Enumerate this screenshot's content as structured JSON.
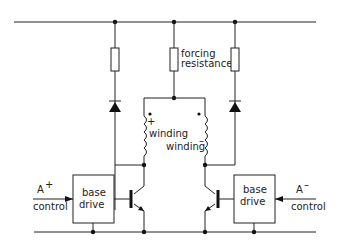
{
  "diagram": {
    "type": "circuit",
    "labels": {
      "forcing_line1": "forcing",
      "forcing_line2": "resistance",
      "winding_plus_sign": "+",
      "winding_plus": "winding",
      "winding_minus": "winding",
      "winding_minus_sign": "–",
      "left_base_line1": "base",
      "left_base_line2": "drive",
      "right_base_line1": "base",
      "right_base_line2": "drive",
      "a_plus": "A",
      "a_plus_sup": "+",
      "a_plus_control": "control",
      "a_minus": "A",
      "a_minus_sup": "–",
      "a_minus_control": "control"
    }
  }
}
